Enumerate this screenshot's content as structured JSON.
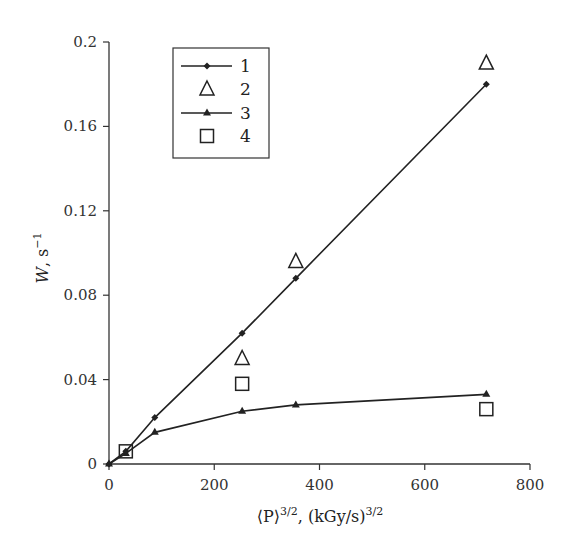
{
  "chart_data": {
    "type": "line",
    "title": "",
    "xlabel": "⟨P⟩^3/2, (kGy/s)^3/2",
    "xlabel_parts": {
      "main": "⟨P⟩",
      "sup1": "3/2",
      "mid": ", (kGy/s)",
      "sup2": "3/2"
    },
    "ylabel": "W, s−1",
    "ylabel_parts": {
      "main": "W",
      "mid": ", s",
      "sup": "−1"
    },
    "xlim": [
      0,
      800
    ],
    "ylim": [
      0,
      0.2
    ],
    "xticks": [
      0,
      200,
      400,
      600,
      800
    ],
    "xtick_labels": [
      "0",
      "200",
      "400",
      "600",
      "800"
    ],
    "yticks": [
      0,
      0.04,
      0.08,
      0.12,
      0.16,
      0.2
    ],
    "ytick_labels": [
      "0",
      "0.04",
      "0.08",
      "0.12",
      "0.16",
      "0.2"
    ],
    "grid": false,
    "legend_position": "upper left (inset box)",
    "series": [
      {
        "name": "1",
        "marker": "diamond-filled",
        "line": true,
        "x": [
          0,
          32,
          87,
          253,
          355,
          717
        ],
        "y": [
          0,
          0.006,
          0.022,
          0.062,
          0.088,
          0.18
        ]
      },
      {
        "name": "2",
        "marker": "triangle-open",
        "line": false,
        "x": [
          253,
          355,
          717
        ],
        "y": [
          0.05,
          0.096,
          0.19
        ]
      },
      {
        "name": "3",
        "marker": "triangle-filled",
        "line": true,
        "x": [
          0,
          32,
          87,
          253,
          355,
          717
        ],
        "y": [
          0,
          0.005,
          0.015,
          0.025,
          0.028,
          0.033
        ]
      },
      {
        "name": "4",
        "marker": "square-open",
        "line": false,
        "x": [
          32,
          253,
          717
        ],
        "y": [
          0.006,
          0.038,
          0.026
        ]
      }
    ]
  },
  "colors": {
    "axis": "#333333",
    "series": "#222222",
    "background": "#ffffff"
  }
}
